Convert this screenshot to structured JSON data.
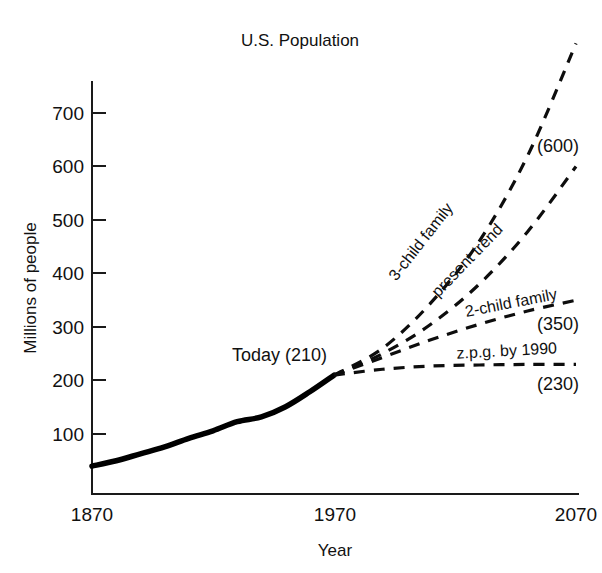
{
  "chart_data": {
    "type": "line",
    "title": "U.S. Population",
    "xlabel": "Year",
    "ylabel": "Millions of people",
    "xlim": [
      1870,
      2070
    ],
    "ylim": [
      0,
      760
    ],
    "xticks": [
      "1870",
      "1970",
      "2070"
    ],
    "yticks": [
      "100",
      "200",
      "300",
      "400",
      "500",
      "600",
      "700"
    ],
    "grid": false,
    "legend": "inline-labels",
    "annotations": [
      {
        "text": "Today (210)",
        "x": 1970,
        "y": 210
      }
    ],
    "series": [
      {
        "name": "historical",
        "label": "",
        "style": "solid",
        "x": [
          1870,
          1880,
          1890,
          1900,
          1910,
          1920,
          1930,
          1940,
          1950,
          1960,
          1970
        ],
        "values": [
          40,
          50,
          63,
          76,
          92,
          106,
          123,
          132,
          151,
          179,
          210
        ]
      },
      {
        "name": "3-child family",
        "label": "3-child family",
        "style": "dashed",
        "endpoint_label": "",
        "x": [
          1970,
          1990,
          2010,
          2030,
          2050,
          2070
        ],
        "values": [
          210,
          260,
          345,
          460,
          620,
          830
        ]
      },
      {
        "name": "present trend",
        "label": "present trend",
        "style": "dashed",
        "endpoint_label": "(600)",
        "x": [
          1970,
          1990,
          2010,
          2030,
          2050,
          2070
        ],
        "values": [
          210,
          250,
          305,
          380,
          478,
          600
        ]
      },
      {
        "name": "2-child family",
        "label": "2-child family",
        "style": "dashed",
        "endpoint_label": "(350)",
        "x": [
          1970,
          1990,
          2010,
          2030,
          2050,
          2070
        ],
        "values": [
          210,
          243,
          276,
          305,
          330,
          350
        ]
      },
      {
        "name": "z.p.g. by 1990",
        "label": "z.p.g. by 1990",
        "style": "dashed",
        "endpoint_label": "(230)",
        "x": [
          1970,
          1990,
          2010,
          2030,
          2050,
          2070
        ],
        "values": [
          210,
          221,
          227,
          229,
          230,
          230
        ]
      }
    ]
  },
  "chart": {
    "title": "U.S. Population",
    "x_axis_title": "Year",
    "y_axis_title": "Millions of people",
    "x_tick_labels": [
      "1870",
      "1970",
      "2070"
    ],
    "y_tick_labels": [
      "700",
      "600",
      "500",
      "400",
      "300",
      "200",
      "100"
    ],
    "annotation_today": "Today (210)",
    "series_labels": {
      "three_child": "3-child family",
      "present_trend": "present trend",
      "two_child": "2-child family",
      "zpg": "z.p.g. by 1990"
    },
    "endpoint_values": {
      "present_trend": "(600)",
      "two_child": "(350)",
      "zpg": "(230)"
    },
    "colors": {
      "ink": "#111111",
      "background": "#ffffff"
    }
  }
}
